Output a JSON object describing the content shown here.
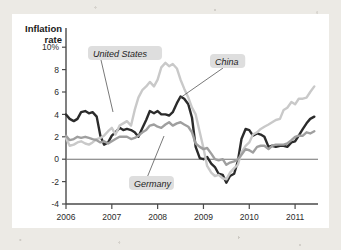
{
  "figure": {
    "y_axis_title_line1": "Inflation",
    "y_axis_title_line2": "rate",
    "x_axis_title": "Year"
  },
  "chart_data": {
    "type": "line",
    "title": "",
    "xlabel": "Year",
    "ylabel": "Inflation rate",
    "ylim": [
      -4,
      11
    ],
    "xlim": [
      2006.0,
      2011.5
    ],
    "grid": false,
    "legend": "inline-annotations",
    "ytick_labels": [
      "10%",
      "8",
      "6",
      "4",
      "2",
      "0",
      "-2",
      "-4"
    ],
    "ytick_values": [
      10,
      8,
      6,
      4,
      2,
      0,
      -2,
      -4
    ],
    "xtick_labels": [
      "2006",
      "2007",
      "2008",
      "2009",
      "2010",
      "2011"
    ],
    "xtick_values": [
      2006,
      2007,
      2008,
      2009,
      2010,
      2011
    ],
    "zero_line": 0,
    "annotations": [
      {
        "text": "United States",
        "series": "United States",
        "label_x": 81,
        "label_y": 41,
        "leader_to_x": 101,
        "leader_to_y": 98
      },
      {
        "text": "China",
        "series": "China",
        "label_x": 203,
        "label_y": 49,
        "leader_to_x": 168,
        "leader_to_y": 84
      },
      {
        "text": "Germany",
        "series": "Germany",
        "label_x": 122,
        "label_y": 171,
        "leader_to_x": 152,
        "leader_to_y": 122
      }
    ],
    "series": [
      {
        "name": "United States",
        "color": "#2b2b2b",
        "width": 2.4,
        "x": [
          2006.0,
          2006.08,
          2006.17,
          2006.25,
          2006.33,
          2006.42,
          2006.5,
          2006.58,
          2006.67,
          2006.75,
          2006.83,
          2006.92,
          2007.0,
          2007.08,
          2007.17,
          2007.25,
          2007.33,
          2007.42,
          2007.5,
          2007.58,
          2007.67,
          2007.75,
          2007.83,
          2007.92,
          2008.0,
          2008.08,
          2008.17,
          2008.25,
          2008.33,
          2008.42,
          2008.5,
          2008.58,
          2008.67,
          2008.75,
          2008.83,
          2008.92,
          2009.0,
          2009.08,
          2009.17,
          2009.25,
          2009.33,
          2009.42,
          2009.5,
          2009.58,
          2009.67,
          2009.75,
          2009.83,
          2009.92,
          2010.0,
          2010.08,
          2010.17,
          2010.25,
          2010.33,
          2010.42,
          2010.5,
          2010.58,
          2010.67,
          2010.75,
          2010.83,
          2010.92,
          2011.0,
          2011.08,
          2011.17,
          2011.25,
          2011.33,
          2011.42
        ],
        "values": [
          4.0,
          3.6,
          3.4,
          3.6,
          4.2,
          4.3,
          4.1,
          4.2,
          3.8,
          2.1,
          1.3,
          1.5,
          2.1,
          2.4,
          2.8,
          2.6,
          2.7,
          2.6,
          2.4,
          2.0,
          2.8,
          3.5,
          4.3,
          4.1,
          4.3,
          4.0,
          4.0,
          3.9,
          4.2,
          5.0,
          5.6,
          5.4,
          4.9,
          3.7,
          1.1,
          0.1,
          0.0,
          0.2,
          -0.4,
          -0.7,
          -1.3,
          -1.4,
          -2.1,
          -1.5,
          -1.3,
          -0.2,
          1.8,
          2.7,
          2.6,
          2.1,
          2.3,
          2.2,
          2.0,
          1.1,
          1.2,
          1.1,
          1.2,
          1.2,
          1.1,
          1.5,
          1.6,
          2.1,
          2.7,
          3.2,
          3.6,
          3.8
        ]
      },
      {
        "name": "China",
        "color": "#c9c9c9",
        "width": 2.4,
        "x": [
          2006.0,
          2006.08,
          2006.17,
          2006.25,
          2006.33,
          2006.42,
          2006.5,
          2006.58,
          2006.67,
          2006.75,
          2006.83,
          2006.92,
          2007.0,
          2007.08,
          2007.17,
          2007.25,
          2007.33,
          2007.42,
          2007.5,
          2007.58,
          2007.67,
          2007.75,
          2007.83,
          2007.92,
          2008.0,
          2008.08,
          2008.17,
          2008.25,
          2008.33,
          2008.42,
          2008.5,
          2008.58,
          2008.67,
          2008.75,
          2008.83,
          2008.92,
          2009.0,
          2009.08,
          2009.17,
          2009.25,
          2009.33,
          2009.42,
          2009.5,
          2009.58,
          2009.67,
          2009.75,
          2009.83,
          2009.92,
          2010.0,
          2010.08,
          2010.17,
          2010.25,
          2010.33,
          2010.42,
          2010.5,
          2010.58,
          2010.67,
          2010.75,
          2010.83,
          2010.92,
          2011.0,
          2011.08,
          2011.17,
          2011.25,
          2011.33,
          2011.42
        ],
        "values": [
          1.9,
          1.2,
          1.3,
          1.5,
          1.6,
          1.4,
          1.3,
          1.5,
          1.8,
          1.9,
          2.1,
          2.5,
          2.8,
          2.2,
          3.0,
          3.2,
          3.4,
          3.0,
          4.4,
          5.5,
          6.2,
          6.5,
          6.9,
          6.5,
          7.1,
          8.2,
          8.6,
          8.3,
          8.5,
          8.1,
          7.1,
          6.3,
          5.5,
          4.6,
          4.0,
          2.4,
          1.0,
          -0.6,
          -1.2,
          -1.5,
          -1.4,
          -1.7,
          -1.8,
          -1.2,
          -0.8,
          -0.5,
          0.6,
          1.2,
          1.5,
          2.2,
          2.4,
          2.7,
          2.9,
          3.1,
          3.3,
          3.5,
          3.6,
          4.4,
          4.6,
          5.1,
          4.9,
          5.4,
          5.4,
          5.5,
          6.0,
          6.5
        ]
      },
      {
        "name": "Germany",
        "color": "#9f9f9f",
        "width": 2.4,
        "x": [
          2006.0,
          2006.08,
          2006.17,
          2006.25,
          2006.33,
          2006.42,
          2006.5,
          2006.58,
          2006.67,
          2006.75,
          2006.83,
          2006.92,
          2007.0,
          2007.08,
          2007.17,
          2007.25,
          2007.33,
          2007.42,
          2007.5,
          2007.58,
          2007.67,
          2007.75,
          2007.83,
          2007.92,
          2008.0,
          2008.08,
          2008.17,
          2008.25,
          2008.33,
          2008.42,
          2008.5,
          2008.58,
          2008.67,
          2008.75,
          2008.83,
          2008.92,
          2009.0,
          2009.08,
          2009.17,
          2009.25,
          2009.33,
          2009.42,
          2009.5,
          2009.58,
          2009.67,
          2009.75,
          2009.83,
          2009.92,
          2010.0,
          2010.08,
          2010.17,
          2010.25,
          2010.33,
          2010.42,
          2010.5,
          2010.58,
          2010.67,
          2010.75,
          2010.83,
          2010.92,
          2011.0,
          2011.08,
          2011.17,
          2011.25,
          2011.33,
          2011.42
        ],
        "values": [
          2.1,
          1.7,
          1.8,
          2.0,
          1.9,
          2.0,
          1.9,
          1.8,
          1.7,
          1.5,
          1.6,
          1.4,
          1.6,
          1.8,
          2.0,
          2.0,
          2.0,
          1.8,
          1.9,
          2.1,
          2.4,
          2.6,
          3.0,
          3.1,
          2.9,
          2.8,
          3.1,
          3.3,
          3.0,
          3.2,
          3.3,
          3.1,
          2.9,
          2.4,
          1.4,
          1.1,
          0.9,
          1.0,
          0.5,
          0.0,
          -0.1,
          0.0,
          -0.5,
          -0.3,
          -0.2,
          0.0,
          0.4,
          0.9,
          0.8,
          0.6,
          1.1,
          1.2,
          1.2,
          0.9,
          1.2,
          1.3,
          1.3,
          1.3,
          1.4,
          1.7,
          2.0,
          2.1,
          2.1,
          2.4,
          2.3,
          2.5
        ]
      }
    ]
  }
}
